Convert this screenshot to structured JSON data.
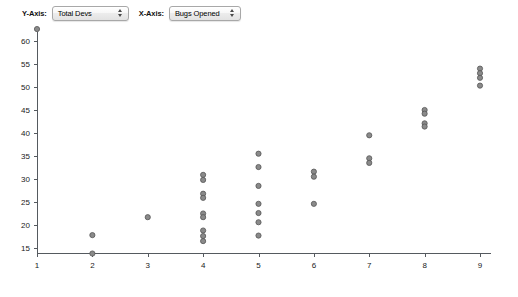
{
  "controls": {
    "y_axis": {
      "label": "Y-Axis:",
      "selected": "Total Devs",
      "arrow_icon": "up-down-arrows-icon"
    },
    "x_axis": {
      "label": "X-Axis:",
      "selected": "Bugs Opened",
      "arrow_icon": "up-down-arrows-icon"
    }
  },
  "chart_data": {
    "type": "scatter",
    "title": "",
    "xlabel": "Bugs Opened",
    "ylabel": "Total Devs",
    "xlim": [
      1,
      9.6
    ],
    "ylim": [
      13.2,
      63.5
    ],
    "xticks": [
      1,
      2,
      3,
      4,
      5,
      6,
      7,
      8,
      9
    ],
    "yticks": [
      15,
      20,
      25,
      30,
      35,
      40,
      45,
      50,
      55,
      60
    ],
    "xticklabels": [
      "1",
      "2",
      "3",
      "4",
      "5",
      "6",
      "7",
      "8",
      "9"
    ],
    "yticklabels": [
      "15",
      "20",
      "25",
      "30",
      "35",
      "40",
      "45",
      "50",
      "55",
      "60"
    ],
    "grid": false,
    "legend": "none",
    "marker_color": "#8a8a8a",
    "marker_edge_color": "#555555",
    "points": [
      {
        "x": 1,
        "y": 62.6
      },
      {
        "x": 2,
        "y": 17.8
      },
      {
        "x": 2,
        "y": 13.8
      },
      {
        "x": 3,
        "y": 21.7
      },
      {
        "x": 4,
        "y": 30.9
      },
      {
        "x": 4,
        "y": 29.8
      },
      {
        "x": 4,
        "y": 26.8
      },
      {
        "x": 4,
        "y": 25.9
      },
      {
        "x": 4,
        "y": 22.5
      },
      {
        "x": 4,
        "y": 21.7
      },
      {
        "x": 4,
        "y": 18.8
      },
      {
        "x": 4,
        "y": 17.6
      },
      {
        "x": 4,
        "y": 16.5
      },
      {
        "x": 5,
        "y": 35.5
      },
      {
        "x": 5,
        "y": 32.6
      },
      {
        "x": 5,
        "y": 28.5
      },
      {
        "x": 5,
        "y": 24.6
      },
      {
        "x": 5,
        "y": 22.6
      },
      {
        "x": 5,
        "y": 20.6
      },
      {
        "x": 5,
        "y": 17.7
      },
      {
        "x": 6,
        "y": 31.6
      },
      {
        "x": 6,
        "y": 30.5
      },
      {
        "x": 6,
        "y": 24.6
      },
      {
        "x": 7,
        "y": 39.5
      },
      {
        "x": 7,
        "y": 34.5
      },
      {
        "x": 7,
        "y": 33.5
      },
      {
        "x": 8,
        "y": 45.0
      },
      {
        "x": 8,
        "y": 44.2
      },
      {
        "x": 8,
        "y": 42.1
      },
      {
        "x": 8,
        "y": 41.4
      },
      {
        "x": 9,
        "y": 54.0
      },
      {
        "x": 9,
        "y": 53.0
      },
      {
        "x": 9,
        "y": 52.0
      },
      {
        "x": 9,
        "y": 50.3
      }
    ]
  }
}
